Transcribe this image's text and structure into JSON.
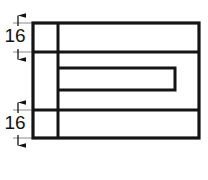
{
  "drawing": {
    "title": "Rectangular part front view with internal slot",
    "background_color": "#ffffff",
    "line_color": "#141414",
    "thin_line_color": "#8a8a8a",
    "outline": {
      "name": "outer-rectangle",
      "x": 33,
      "y": 23,
      "width": 166,
      "height": 115,
      "stroke_width": 3.2
    },
    "internal_lines": [
      {
        "name": "upper-horizontal-divider",
        "x1": 33,
        "y1": 52,
        "x2": 199,
        "y2": 52,
        "stroke_width": 3.0
      },
      {
        "name": "lower-horizontal-divider",
        "x1": 33,
        "y1": 110,
        "x2": 199,
        "y2": 110,
        "stroke_width": 3.0
      },
      {
        "name": "vertical-divider",
        "x1": 58,
        "y1": 23,
        "x2": 58,
        "y2": 138,
        "stroke_width": 3.0
      }
    ],
    "slot": {
      "name": "internal-slot",
      "path": "M 58 68 L 175 68 L 175 90 L 58 90",
      "stroke_width": 3.0,
      "open_side": "left",
      "left_x": 58,
      "right_x": 175,
      "top_y": 68,
      "bottom_y": 90
    },
    "dimensions": [
      {
        "name": "dimension-16-top",
        "label": "16",
        "value": 16,
        "orientation": "vertical",
        "dim_line_x": 18,
        "from_y": 23,
        "to_y": 52,
        "arrow_top_y": 15,
        "arrow_bottom_y": 60,
        "text_x": 15,
        "text_y": 37,
        "extension_lines": [
          {
            "x1": 13,
            "y1": 23,
            "x2": 35,
            "y2": 23
          },
          {
            "x1": 13,
            "y1": 52,
            "x2": 35,
            "y2": 52
          }
        ]
      },
      {
        "name": "dimension-16-bottom",
        "label": "16",
        "value": 16,
        "orientation": "vertical",
        "dim_line_x": 18,
        "from_y": 110,
        "to_y": 138,
        "arrow_top_y": 102,
        "arrow_bottom_y": 146,
        "text_x": 15,
        "text_y": 124,
        "extension_lines": [
          {
            "x1": 13,
            "y1": 110,
            "x2": 35,
            "y2": 110
          },
          {
            "x1": 13,
            "y1": 138,
            "x2": 35,
            "y2": 138
          }
        ]
      }
    ]
  }
}
